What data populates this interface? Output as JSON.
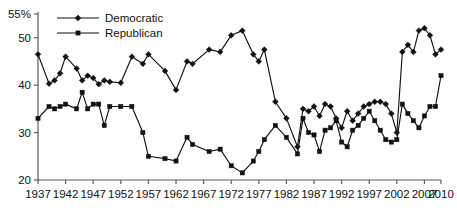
{
  "chart_data": {
    "type": "line",
    "title": "",
    "xlabel": "",
    "ylabel": "",
    "xlim": [
      1937,
      2010
    ],
    "ylim": [
      20,
      55
    ],
    "grid": false,
    "legend_position": "top-left",
    "x_ticks": [
      1937,
      1942,
      1947,
      1952,
      1957,
      1962,
      1967,
      1972,
      1977,
      1982,
      1987,
      1992,
      1997,
      2002,
      2007,
      2010
    ],
    "x_tick_labels": [
      "1937",
      "1942",
      "1947",
      "1952",
      "1957",
      "1962",
      "1967",
      "1972",
      "1977",
      "1982",
      "1987",
      "1992",
      "1997",
      "2002",
      "2007",
      "2010"
    ],
    "y_ticks": [
      20,
      30,
      40,
      50,
      55
    ],
    "y_tick_labels": [
      "20",
      "30",
      "40",
      "50",
      "55%"
    ],
    "series": [
      {
        "name": "Democratic",
        "marker": "diamond",
        "color": "#111111",
        "x": [
          1937,
          1939,
          1940,
          1941,
          1942,
          1944,
          1945,
          1946,
          1947,
          1948,
          1949,
          1950,
          1952,
          1954,
          1956,
          1957,
          1960,
          1962,
          1964,
          1965,
          1968,
          1970,
          1972,
          1974,
          1976,
          1977,
          1978,
          1980,
          1982,
          1984,
          1985,
          1986,
          1987,
          1988,
          1989,
          1990,
          1991,
          1992,
          1993,
          1994,
          1995,
          1996,
          1997,
          1998,
          1999,
          2000,
          2001,
          2002,
          2003,
          2004,
          2005,
          2006,
          2007,
          2008,
          2009,
          2010
        ],
        "y": [
          46.5,
          40.3,
          41.0,
          42.5,
          46.0,
          43.5,
          41.0,
          42.0,
          41.5,
          40.2,
          41.0,
          40.7,
          40.5,
          46.0,
          44.5,
          46.5,
          43.0,
          39.0,
          45.0,
          44.5,
          47.5,
          47.0,
          50.5,
          51.5,
          46.5,
          45.0,
          47.5,
          36.5,
          33.0,
          27.0,
          35.0,
          34.5,
          35.5,
          33.5,
          36.0,
          35.5,
          33.0,
          31.0,
          34.5,
          32.5,
          34.0,
          35.5,
          36.0,
          36.5,
          36.5,
          36.0,
          34.0,
          30.0,
          47.0,
          48.5,
          47.0,
          51.5,
          52.0,
          50.5,
          46.5,
          47.5
        ]
      },
      {
        "name": "Republican",
        "marker": "square",
        "color": "#111111",
        "x": [
          1937,
          1939,
          1940,
          1941,
          1942,
          1944,
          1945,
          1946,
          1947,
          1948,
          1949,
          1950,
          1952,
          1954,
          1956,
          1957,
          1960,
          1962,
          1964,
          1965,
          1968,
          1970,
          1972,
          1974,
          1976,
          1977,
          1978,
          1980,
          1982,
          1984,
          1985,
          1986,
          1987,
          1988,
          1989,
          1990,
          1991,
          1992,
          1993,
          1994,
          1995,
          1996,
          1997,
          1998,
          1999,
          2000,
          2001,
          2002,
          2003,
          2004,
          2005,
          2006,
          2007,
          2008,
          2009,
          2010
        ],
        "y": [
          33.0,
          35.5,
          35.0,
          35.5,
          36.0,
          35.0,
          38.5,
          35.0,
          36.0,
          36.0,
          31.5,
          35.5,
          35.5,
          35.5,
          30.0,
          25.0,
          24.5,
          24.0,
          29.0,
          27.5,
          26.0,
          26.5,
          23.0,
          21.5,
          24.0,
          26.0,
          28.5,
          31.5,
          29.0,
          25.5,
          33.0,
          30.0,
          29.5,
          26.0,
          30.5,
          31.0,
          32.5,
          28.0,
          27.0,
          30.5,
          31.5,
          33.0,
          34.5,
          32.5,
          30.5,
          28.5,
          28.0,
          28.5,
          36.0,
          34.0,
          32.5,
          31.0,
          33.5,
          35.5,
          35.5,
          42.0
        ]
      }
    ]
  },
  "legend": {
    "items": [
      {
        "label": "Democratic",
        "marker": "diamond"
      },
      {
        "label": "Republican",
        "marker": "square"
      }
    ]
  }
}
